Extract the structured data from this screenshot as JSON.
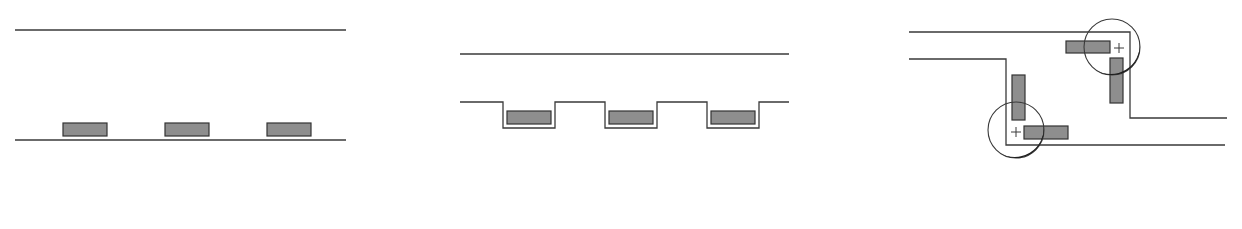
{
  "colors": {
    "line": "#3a3a3a",
    "block_fill": "#8e8e8e",
    "block_stroke": "#333333",
    "background": "#ffffff"
  },
  "panels": [
    {
      "id": "flat-channel",
      "description": "Straight channel between two parallel lines with three blocks resting on the bottom line",
      "lines": [
        {
          "x1": 15,
          "y1": 30,
          "x2": 346,
          "y2": 30
        },
        {
          "x1": 15,
          "y1": 140,
          "x2": 346,
          "y2": 140
        }
      ],
      "blocks": [
        {
          "x": 63,
          "y": 123,
          "w": 44,
          "h": 13
        },
        {
          "x": 165,
          "y": 123,
          "w": 44,
          "h": 13
        },
        {
          "x": 267,
          "y": 123,
          "w": 44,
          "h": 13
        }
      ]
    },
    {
      "id": "recessed-channel",
      "description": "Channel whose bottom wall has three rectangular recesses, each holding a block",
      "top_line": {
        "x1": 460,
        "y1": 54,
        "x2": 789,
        "y2": 54
      },
      "bottom_path": "M460,102 L503,102 L503,128 L555,128 L555,102 L605,102 L605,128 L657,128 L657,102 L707,102 L707,128 L759,128 L759,102 L789,102",
      "blocks": [
        {
          "x": 507,
          "y": 111,
          "w": 44,
          "h": 13
        },
        {
          "x": 609,
          "y": 111,
          "w": 44,
          "h": 13
        },
        {
          "x": 711,
          "y": 111,
          "w": 44,
          "h": 13
        }
      ]
    },
    {
      "id": "cornering-channel",
      "description": "Z-shaped channel with two corners; at each corner a circle with a center cross shows a block rotating from horizontal to vertical",
      "outer_path": "M909,32 L1130,32 L1130,118 L1227,118",
      "inner_path": "M909,59 L1006,59 L1006,145 L1225,145",
      "corners": [
        {
          "circle": {
            "cx": 1112,
            "cy": 47,
            "r": 28
          },
          "cross": {
            "cx": 1119,
            "cy": 48,
            "size": 10
          },
          "blocks": [
            {
              "x": 1066,
              "y": 41,
              "w": 44,
              "h": 12
            },
            {
              "x": 1110,
              "y": 58,
              "w": 13,
              "h": 45
            }
          ]
        },
        {
          "circle": {
            "cx": 1016,
            "cy": 130,
            "r": 28
          },
          "cross": {
            "cx": 1016,
            "cy": 132,
            "size": 10
          },
          "blocks": [
            {
              "x": 1012,
              "y": 75,
              "w": 13,
              "h": 45
            },
            {
              "x": 1024,
              "y": 126,
              "w": 44,
              "h": 13
            }
          ]
        }
      ]
    }
  ]
}
